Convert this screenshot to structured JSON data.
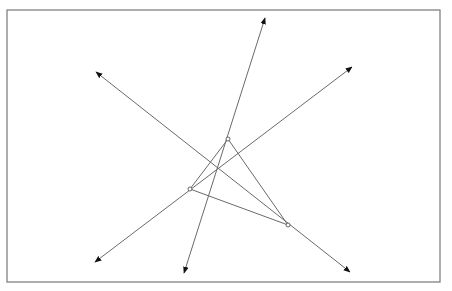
{
  "diagram": {
    "type": "geometry",
    "frame": {
      "x": 7,
      "y": 10,
      "width": 433,
      "height": 272,
      "stroke": "#777777"
    },
    "line_color": "#6a6a6a",
    "arrow_color": "#111111",
    "vertices": [
      {
        "id": "top",
        "x": 228,
        "y": 139
      },
      {
        "id": "left",
        "x": 190,
        "y": 189
      },
      {
        "id": "right",
        "x": 288,
        "y": 225
      }
    ],
    "triangle_edges": [
      [
        "top",
        "left"
      ],
      [
        "left",
        "right"
      ],
      [
        "top",
        "right"
      ]
    ],
    "rays": [
      {
        "id": "line-through-top",
        "through": "top",
        "start": {
          "x": 184,
          "y": 273
        },
        "end": {
          "x": 265,
          "y": 18
        }
      },
      {
        "id": "line-through-right",
        "through": "right",
        "start": {
          "x": 96,
          "y": 72
        },
        "end": {
          "x": 350,
          "y": 272
        }
      },
      {
        "id": "line-through-left",
        "through": "left",
        "start": {
          "x": 95,
          "y": 262
        },
        "end": {
          "x": 352,
          "y": 67
        }
      }
    ]
  }
}
